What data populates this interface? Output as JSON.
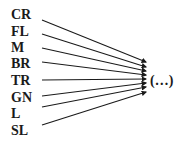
{
  "diagram": {
    "sources": [
      {
        "label": "CR",
        "y": 14,
        "line_start": [
          42,
          20
        ],
        "line_end": [
          146,
          62
        ]
      },
      {
        "label": "FL",
        "y": 31,
        "line_start": [
          42,
          34
        ],
        "line_end": [
          146,
          67
        ]
      },
      {
        "label": "M",
        "y": 47,
        "line_start": [
          42,
          48
        ],
        "line_end": [
          146,
          71
        ]
      },
      {
        "label": "BR",
        "y": 63,
        "line_start": [
          42,
          62
        ],
        "line_end": [
          146,
          75
        ]
      },
      {
        "label": "TR",
        "y": 80,
        "line_start": [
          42,
          80
        ],
        "line_end": [
          146,
          79
        ]
      },
      {
        "label": "GN",
        "y": 97,
        "line_start": [
          42,
          96
        ],
        "line_end": [
          146,
          83
        ]
      },
      {
        "label": "L",
        "y": 113,
        "line_start": [
          42,
          107
        ],
        "line_end": [
          146,
          87
        ]
      },
      {
        "label": "SL",
        "y": 130,
        "line_start": [
          42,
          125
        ],
        "line_end": [
          146,
          92
        ]
      }
    ],
    "target": {
      "label": "(…)",
      "x": 150,
      "y": 80
    }
  }
}
